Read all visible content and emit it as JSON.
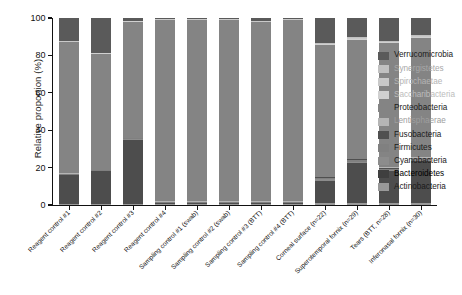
{
  "chart_data": {
    "type": "bar",
    "title": "",
    "xlabel": "",
    "ylabel": "Relative proportion (%)",
    "ylim": [
      0,
      100
    ],
    "yticks": [
      0,
      20,
      40,
      60,
      80,
      100
    ],
    "grid": false,
    "stacked": true,
    "legend_position": "right",
    "categories": [
      "Reagent control #1",
      "Reagent control #2",
      "Reagent control #3",
      "Reagent control #4",
      "Sampling control #1 (swab)",
      "Sampling control #2 (swab)",
      "Sampling control #3 (BTT)",
      "Sampling control #4 (BTT)",
      "Corneal surface (n=22)",
      "Superotemporal fornix (n=29)",
      "Tears (BTT, n=28)",
      "Inferonasal fornix (n=30)"
    ],
    "series": [
      {
        "name": "Actinobacteria",
        "color": "#999999",
        "values": [
          0.5,
          0.5,
          0.5,
          0.5,
          0.5,
          0.5,
          0.5,
          0.5,
          1.0,
          1.0,
          1.0,
          1.0
        ]
      },
      {
        "name": "Bacteroidetes",
        "color": "#4d4d4d",
        "values": [
          15.5,
          17.5,
          34.5,
          0.5,
          0.5,
          0.5,
          0.5,
          0.5,
          12.0,
          21.5,
          17.0,
          22.5
        ]
      },
      {
        "name": "Cyanobacteria",
        "color": "#8c8c8c",
        "values": [
          0.3,
          0.3,
          0.3,
          0.3,
          0.3,
          0.3,
          0.3,
          0.3,
          0.7,
          0.7,
          0.7,
          0.7
        ]
      },
      {
        "name": "Firmicutes",
        "color": "#808080",
        "values": [
          0.3,
          0.3,
          0.3,
          0.3,
          0.3,
          0.3,
          0.3,
          0.3,
          0.7,
          0.7,
          0.7,
          0.7
        ]
      },
      {
        "name": "Fusobacteria",
        "color": "#4f4f4f",
        "values": [
          0.2,
          0.2,
          0.2,
          0.2,
          0.2,
          0.2,
          0.2,
          0.2,
          0.5,
          0.5,
          0.5,
          0.5
        ]
      },
      {
        "name": "Lentisphaerae",
        "color": "#b5b5b5",
        "values": [
          0.2,
          0.2,
          0.2,
          0.2,
          0.2,
          0.2,
          0.2,
          0.2,
          0.3,
          0.3,
          0.3,
          0.3
        ]
      },
      {
        "name": "Proteobacteria",
        "color": "#848484",
        "values": [
          70.5,
          62.0,
          62.0,
          97.3,
          97.3,
          97.3,
          96.0,
          97.3,
          70.3,
          63.8,
          66.3,
          63.8
        ]
      },
      {
        "name": "Saccharibacteria",
        "color": "#d0d0d0",
        "values": [
          0.2,
          0.2,
          0.2,
          0.2,
          0.2,
          0.2,
          0.2,
          0.2,
          0.5,
          0.5,
          0.5,
          0.5
        ]
      },
      {
        "name": "Spirochaetae",
        "color": "#c9c9c9",
        "values": [
          0.2,
          0.2,
          0.2,
          0.2,
          0.2,
          0.2,
          0.2,
          0.2,
          0.4,
          0.4,
          0.4,
          0.4
        ]
      },
      {
        "name": "Synergistetes",
        "color": "#c0c0c0",
        "values": [
          0.2,
          0.2,
          0.2,
          0.2,
          0.2,
          0.2,
          0.2,
          0.2,
          0.4,
          0.4,
          0.4,
          0.4
        ]
      },
      {
        "name": "Verrucomicrobia",
        "color": "#5a5a5a",
        "values": [
          12.4,
          18.4,
          1.4,
          0.6,
          0.6,
          0.6,
          1.6,
          0.6,
          13.2,
          10.2,
          12.2,
          9.2
        ]
      }
    ]
  },
  "legend": {
    "items": [
      {
        "label": "Verrucomicrobia",
        "color": "#5a5a5a",
        "text_color": "#1a1a1a"
      },
      {
        "label": "Synergistetes",
        "color": "#c0c0c0",
        "text_color": "#a8a8a8"
      },
      {
        "label": "Spirochaetae",
        "color": "#c9c9c9",
        "text_color": "#b4b4b4"
      },
      {
        "label": "Saccharibacteria",
        "color": "#d0d0d0",
        "text_color": "#bcbcbc"
      },
      {
        "label": "Proteobacteria",
        "color": "#848484",
        "text_color": "#1a1a1a"
      },
      {
        "label": "Lentisphaerae",
        "color": "#b5b5b5",
        "text_color": "#9e9e9e"
      },
      {
        "label": "Fusobacteria",
        "color": "#4f4f4f",
        "text_color": "#1a1a1a"
      },
      {
        "label": "Firmicutes",
        "color": "#808080",
        "text_color": "#1a1a1a"
      },
      {
        "label": "Cyanobacteria",
        "color": "#8c8c8c",
        "text_color": "#1a1a1a"
      },
      {
        "label": "Bacteroidetes",
        "color": "#3f3f3f",
        "text_color": "#000000"
      },
      {
        "label": "Actinobacteria",
        "color": "#999999",
        "text_color": "#1a1a1a"
      }
    ]
  },
  "axes": {
    "background": "#ffffff",
    "line_color": "#111111"
  }
}
